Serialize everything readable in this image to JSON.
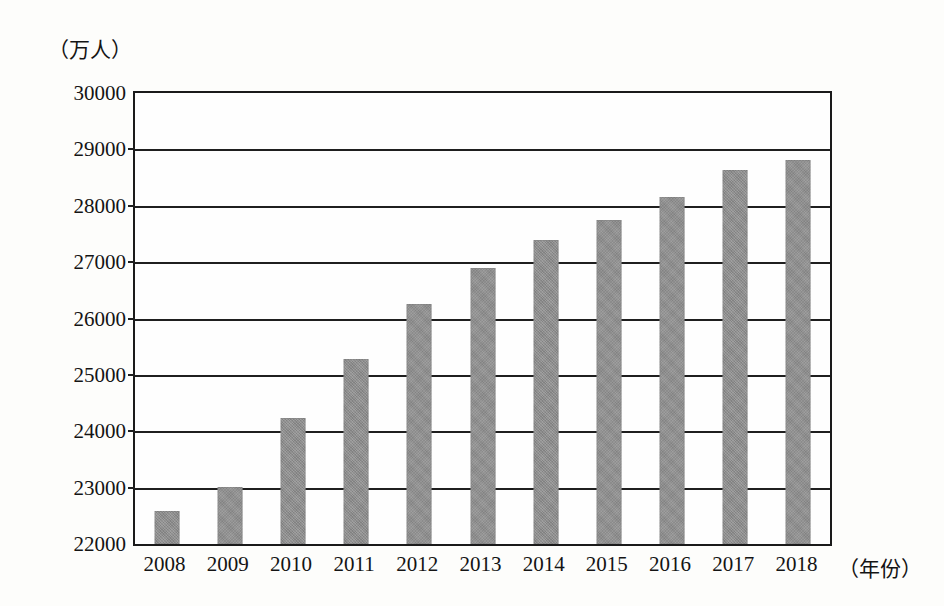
{
  "chart_data": {
    "type": "bar",
    "title": "",
    "subtitle": "",
    "xlabel": "（年份）",
    "ylabel": "（万人）",
    "categories": [
      "2008",
      "2009",
      "2010",
      "2011",
      "2012",
      "2013",
      "2014",
      "2015",
      "2016",
      "2017",
      "2018"
    ],
    "values": [
      22580,
      23020,
      24230,
      25280,
      26260,
      26900,
      27390,
      27750,
      28160,
      28630,
      28820
    ],
    "ylim": [
      22000,
      30000
    ],
    "y_ticks": [
      22000,
      23000,
      24000,
      25000,
      26000,
      27000,
      28000,
      29000,
      30000
    ],
    "y_tick_labels": [
      "22000",
      "23000",
      "24000",
      "25000",
      "26000",
      "27000",
      "28000",
      "29000",
      "30000"
    ],
    "grid": true,
    "grid_axis": "y",
    "legend": false,
    "legend_position": "none",
    "series": [
      {
        "name": "",
        "color": "#8e8e8e",
        "values": [
          22580,
          23020,
          24230,
          25280,
          26260,
          26900,
          27390,
          27750,
          28160,
          28630,
          28820
        ]
      }
    ],
    "annotations": []
  },
  "figure": {
    "background_color": "#fdfdfb",
    "axis_color": "#1a1a1a",
    "bar_color": "#8e8e8e"
  }
}
